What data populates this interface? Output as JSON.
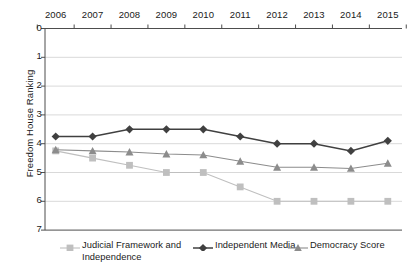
{
  "chart_data": {
    "type": "line",
    "title": "",
    "xlabel": "",
    "ylabel": "Freedom House Ranking",
    "categories": [
      "2006",
      "2007",
      "2008",
      "2009",
      "2010",
      "2011",
      "2012",
      "2013",
      "2014",
      "2015"
    ],
    "ylim": [
      0,
      7
    ],
    "y_inverted": true,
    "yticks": [
      "0",
      "1",
      "2",
      "3",
      "4",
      "5",
      "6",
      "7"
    ],
    "grid": true,
    "legend_position": "bottom",
    "x_axis_position": "top",
    "series": [
      {
        "name": "Judicial Framework and Independence",
        "marker": "square",
        "color": "#bfbfbf",
        "values": [
          4.25,
          4.5,
          4.75,
          5.0,
          5.0,
          5.5,
          6.0,
          6.0,
          6.0,
          6.0
        ]
      },
      {
        "name": "Independent Media",
        "marker": "diamond",
        "color": "#404040",
        "values": [
          3.75,
          3.75,
          3.5,
          3.5,
          3.5,
          3.75,
          4.0,
          4.0,
          4.25,
          3.9
        ]
      },
      {
        "name": "Democracy Score",
        "marker": "triangle",
        "color": "#8c8c8c",
        "values": [
          4.21,
          4.25,
          4.29,
          4.36,
          4.39,
          4.61,
          4.82,
          4.82,
          4.86,
          4.68
        ]
      }
    ]
  },
  "axes": {
    "y_title": "Freedom House Ranking",
    "y_tick_labels": [
      "0",
      "1",
      "2",
      "3",
      "4",
      "5",
      "6",
      "7"
    ],
    "x_tick_labels": [
      "2006",
      "2007",
      "2008",
      "2009",
      "2010",
      "2011",
      "2012",
      "2013",
      "2014",
      "2015"
    ]
  },
  "legend": {
    "items": [
      {
        "label": "Judicial Framework and Independence",
        "marker": "square-marker",
        "color": "#bfbfbf"
      },
      {
        "label": "Independent Media",
        "marker": "diamond-marker",
        "color": "#404040"
      },
      {
        "label": "Democracy Score",
        "marker": "triangle-marker",
        "color": "#8c8c8c"
      }
    ]
  }
}
